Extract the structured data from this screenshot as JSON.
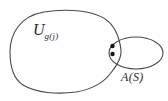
{
  "diagram": {
    "colors": {
      "background": "#fefefe",
      "stroke": "#4a4a4a",
      "dot": "#141414",
      "text": "#2a2a2a"
    },
    "labels": {
      "u_symbol": "U",
      "u_subscript": "g(j)",
      "a_label": "A(S)"
    },
    "dots": {
      "count": 2
    }
  }
}
